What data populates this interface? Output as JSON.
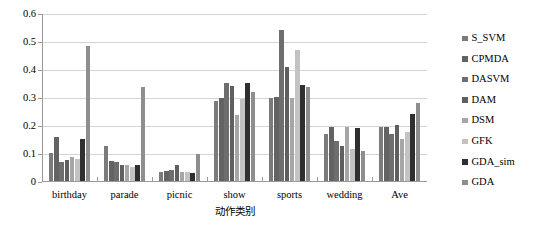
{
  "chart_data": {
    "type": "bar",
    "title": "",
    "xlabel": "动作类别",
    "ylabel": "",
    "ylim": [
      0,
      0.6
    ],
    "yticks": [
      "0",
      "0.1",
      "0.2",
      "0.3",
      "0.4",
      "0.5",
      "0.6"
    ],
    "grid": true,
    "legend_position": "right",
    "categories": [
      "birthday",
      "parade",
      "picnic",
      "show",
      "sports",
      "wedding",
      "Ave"
    ],
    "series": [
      {
        "name": "S_SVM",
        "color": "#7b7b7b",
        "values": [
          0.103,
          0.128,
          0.035,
          0.288,
          0.3,
          0.172,
          0.195
        ]
      },
      {
        "name": "CPMDA",
        "color": "#636363",
        "values": [
          0.16,
          0.075,
          0.038,
          0.3,
          0.305,
          0.198,
          0.197
        ]
      },
      {
        "name": "DASVM",
        "color": "#6e6e6e",
        "values": [
          0.073,
          0.07,
          0.042,
          0.352,
          0.543,
          0.148,
          0.17
        ]
      },
      {
        "name": "DAM",
        "color": "#5f5f5f",
        "values": [
          0.08,
          0.06,
          0.06,
          0.343,
          0.412,
          0.13,
          0.205
        ]
      },
      {
        "name": "DSM",
        "color": "#a6a6a6",
        "values": [
          0.09,
          0.06,
          0.035,
          0.238,
          0.3,
          0.196,
          0.155
        ]
      },
      {
        "name": "GFK",
        "color": "#c3c3c3",
        "values": [
          0.082,
          0.055,
          0.035,
          0.298,
          0.47,
          0.118,
          0.18
        ]
      },
      {
        "name": "GDA_sim",
        "color": "#2f2f2f",
        "values": [
          0.152,
          0.062,
          0.033,
          0.352,
          0.348,
          0.192,
          0.243
        ]
      },
      {
        "name": "GDA",
        "color": "#8e8e8e",
        "values": [
          0.487,
          0.338,
          0.1,
          0.322,
          0.338,
          0.112,
          0.283
        ]
      }
    ]
  },
  "legend": {
    "items": [
      {
        "label": "S_SVM"
      },
      {
        "label": "CPMDA"
      },
      {
        "label": "DASVM"
      },
      {
        "label": "DAM"
      },
      {
        "label": "DSM"
      },
      {
        "label": "GFK"
      },
      {
        "label": "GDA_sim"
      },
      {
        "label": "GDA"
      }
    ]
  }
}
